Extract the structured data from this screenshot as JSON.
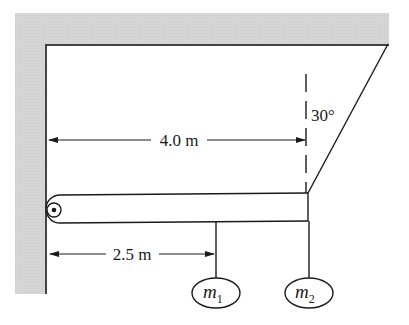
{
  "diagram": {
    "type": "statics-beam",
    "colors": {
      "wall_fill": "#d4d4d4",
      "wall_edge": "#555555",
      "line": "#1a1a1a",
      "background": "#ffffff"
    },
    "labels": {
      "beam_length": "4.0 m",
      "m1_distance": "2.5 m",
      "cable_angle": "30°",
      "mass1_symbol": "m",
      "mass1_sub": "1",
      "mass2_symbol": "m",
      "mass2_sub": "2"
    },
    "components": [
      {
        "name": "wall",
        "kind": "fixed-support"
      },
      {
        "name": "ceiling",
        "kind": "fixed-support"
      },
      {
        "name": "hinge",
        "kind": "pivot"
      },
      {
        "name": "beam",
        "kind": "rigid-body"
      },
      {
        "name": "cable",
        "kind": "tension-member",
        "angle_from_vertical_deg": 30
      },
      {
        "name": "mass-m1",
        "kind": "hanging-mass",
        "distance_from_hinge_m": 2.5
      },
      {
        "name": "mass-m2",
        "kind": "hanging-mass",
        "distance_from_hinge_m": 4.0
      }
    ]
  }
}
